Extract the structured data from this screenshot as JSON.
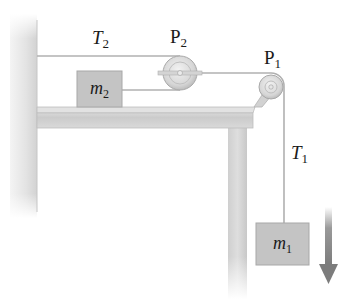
{
  "diagram": {
    "labels": {
      "T2": {
        "main": "T",
        "sub": "2"
      },
      "P2": {
        "main": "P",
        "sub": "2"
      },
      "P1": {
        "main": "P",
        "sub": "1"
      },
      "T1": {
        "main": "T",
        "sub": "1"
      }
    },
    "blocks": {
      "m2": {
        "main": "m",
        "sub": "2"
      },
      "m1": {
        "main": "m",
        "sub": "1"
      }
    },
    "arrow": {
      "direction": "down",
      "meaning": "motion of m1"
    },
    "colors": {
      "block_fill": "#c4c4c4",
      "block_edge": "#a8a8a8",
      "string": "#b0b0b0",
      "table": "#cfcfcf",
      "wall": "#e0e0e0",
      "arrow": "#8a8a8a",
      "text": "#1a1a1a"
    }
  }
}
